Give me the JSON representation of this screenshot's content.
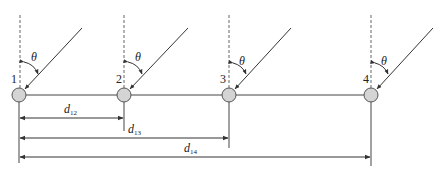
{
  "diagram": {
    "colors": {
      "line": "#333333",
      "dashed": "#555555",
      "node_fill": "#d4d4d4",
      "node_stroke": "#555555"
    },
    "nodes": [
      {
        "id": "1",
        "label": "1",
        "x": 19,
        "angle_label": "θ"
      },
      {
        "id": "2",
        "label": "2",
        "x": 124,
        "angle_label": "θ"
      },
      {
        "id": "3",
        "label": "3",
        "x": 229,
        "angle_label": "θ"
      },
      {
        "id": "4",
        "label": "4",
        "x": 371,
        "angle_label": "θ"
      }
    ],
    "node_y": 95,
    "dimensions": [
      {
        "id": "d12",
        "base": "d",
        "sub": "12",
        "from": "1",
        "to": "2"
      },
      {
        "id": "d13",
        "base": "d",
        "sub": "13",
        "from": "1",
        "to": "3"
      },
      {
        "id": "d14",
        "base": "d",
        "sub": "14",
        "from": "1",
        "to": "4"
      }
    ]
  }
}
